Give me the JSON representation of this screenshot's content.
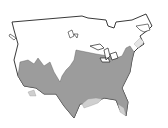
{
  "map": {
    "region": "United States and southern Canada",
    "colors": {
      "background": "#ffffff",
      "land": "#ffffff",
      "outline": "#222222",
      "range_primary": "#9c9c9c",
      "range_secondary": "#cfcfcf"
    },
    "layers": [
      "country-outline",
      "great-lakes",
      "range-primary",
      "range-secondary"
    ]
  }
}
